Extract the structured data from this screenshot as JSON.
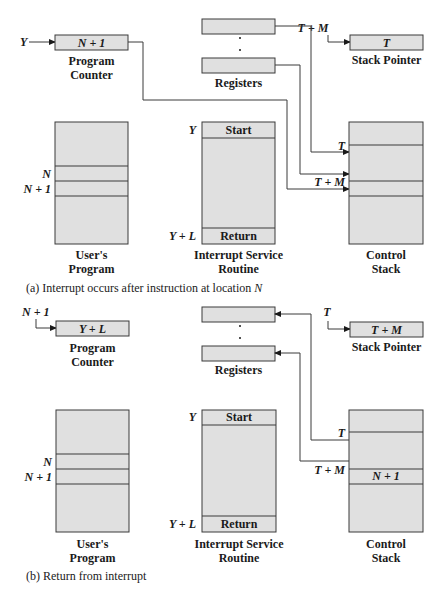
{
  "part_a": {
    "caption_prefix": "(a)  Interrupt occurs after instruction at location ",
    "caption_var": "N",
    "program_counter": {
      "input": "Y",
      "value": "N + 1",
      "label_line1": "Program",
      "label_line2": "Counter"
    },
    "registers": {
      "label": "Registers"
    },
    "stack_pointer": {
      "input": "T + M",
      "value": "T",
      "label": "Stack Pointer"
    },
    "users_program": {
      "label_line1": "User's",
      "label_line2": "Program",
      "marker_n": "N",
      "marker_n1": "N + 1"
    },
    "isr": {
      "start_marker": "Y",
      "start": "Start",
      "return_marker": "Y + L",
      "return": "Return",
      "label_line1": "Interrupt Service",
      "label_line2": "Routine"
    },
    "control_stack": {
      "marker_t": "T",
      "marker_tm": "T + M",
      "label_line1": "Control",
      "label_line2": "Stack"
    }
  },
  "part_b": {
    "caption": "(b)  Return from interrupt",
    "program_counter": {
      "input": "N + 1",
      "value": "Y + L",
      "label_line1": "Program",
      "label_line2": "Counter"
    },
    "registers": {
      "label": "Registers"
    },
    "stack_pointer": {
      "input": "T",
      "value": "T + M",
      "label": "Stack Pointer"
    },
    "users_program": {
      "label_line1": "User's",
      "label_line2": "Program",
      "marker_n": "N",
      "marker_n1": "N + 1"
    },
    "isr": {
      "start_marker": "Y",
      "start": "Start",
      "return_marker": "Y + L",
      "return": "Return",
      "label_line1": "Interrupt Service",
      "label_line2": "Routine"
    },
    "control_stack": {
      "marker_t": "T",
      "marker_tm": "T + M",
      "slot_value": "N + 1",
      "label_line1": "Control",
      "label_line2": "Stack"
    }
  },
  "colors": {
    "box_fill": "#e0e0e0",
    "stroke": "#3a3a3a"
  }
}
